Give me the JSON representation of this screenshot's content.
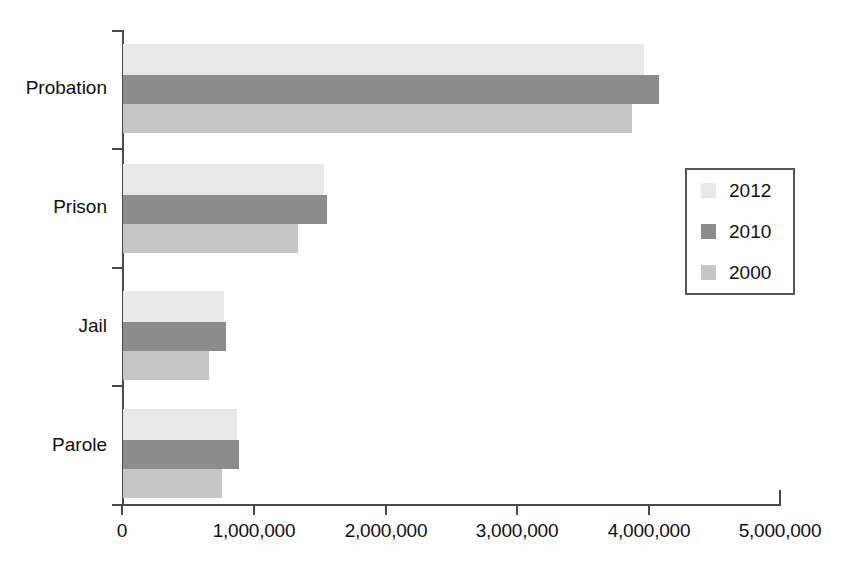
{
  "chart_data": {
    "type": "bar",
    "orientation": "horizontal",
    "title": "",
    "xlabel": "",
    "ylabel": "",
    "categories": [
      "Probation",
      "Prison",
      "Jail",
      "Parole"
    ],
    "series": [
      {
        "name": "2012",
        "color": "#e9e9e9",
        "values": [
          3960000,
          1530000,
          770000,
          870000
        ]
      },
      {
        "name": "2010",
        "color": "#8c8c8c",
        "values": [
          4070000,
          1550000,
          780000,
          880000
        ]
      },
      {
        "name": "2000",
        "color": "#c6c6c6",
        "values": [
          3870000,
          1330000,
          650000,
          750000
        ]
      }
    ],
    "series_draw_order": [
      "2012",
      "2010",
      "2000"
    ],
    "xlim": [
      0,
      5000000
    ],
    "x_ticks": [
      0,
      1000000,
      2000000,
      3000000,
      4000000,
      5000000
    ],
    "x_tick_labels": [
      "0",
      "1,000,000",
      "2,000,000",
      "3,000,000",
      "4,000,000",
      "5,000,000"
    ],
    "grid": false,
    "legend_position": "right",
    "legend_entries": [
      "2012",
      "2010",
      "2000"
    ],
    "axis_color": "#4a4a4a"
  },
  "legend": {
    "items": [
      {
        "label": "2012",
        "color": "#e9e9e9"
      },
      {
        "label": "2010",
        "color": "#8c8c8c"
      },
      {
        "label": "2000",
        "color": "#c6c6c6"
      }
    ]
  },
  "axis": {
    "category_labels": [
      "Probation",
      "Prison",
      "Jail",
      "Parole"
    ],
    "tick_labels": [
      "0",
      "1,000,000",
      "2,000,000",
      "3,000,000",
      "4,000,000",
      "5,000,000"
    ]
  },
  "caption": {
    "text": ""
  }
}
